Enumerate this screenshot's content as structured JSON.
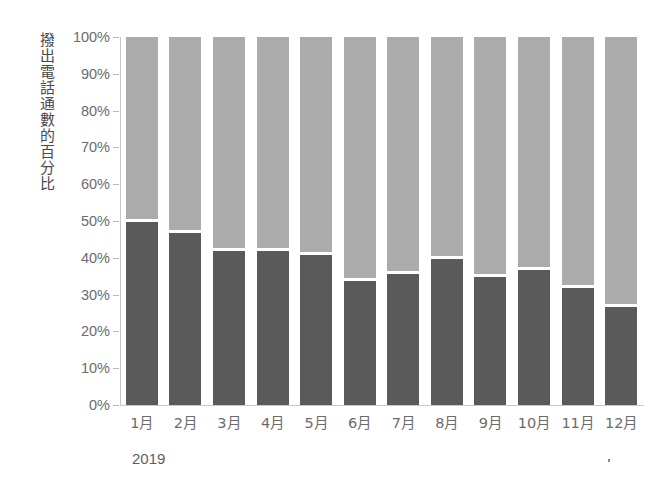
{
  "chart_data": {
    "type": "bar",
    "subtype": "stacked-100-percent",
    "title": "",
    "subtitle": "",
    "xlabel": "",
    "ylabel": "撥出電話通數的百分比",
    "x_group_label": "2019",
    "categories": [
      "1月",
      "2月",
      "3月",
      "4月",
      "5月",
      "6月",
      "7月",
      "8月",
      "9月",
      "10月",
      "11月",
      "12月"
    ],
    "ylim": [
      0,
      100
    ],
    "ytick_labels": [
      "0%",
      "10%",
      "20%",
      "30%",
      "40%",
      "50%",
      "60%",
      "70%",
      "80%",
      "90%",
      "100%"
    ],
    "ytick_values": [
      0,
      10,
      20,
      30,
      40,
      50,
      60,
      70,
      80,
      90,
      100
    ],
    "grid": false,
    "legend_position": "none",
    "series": [
      {
        "name": "下段（深灰）",
        "color": "#5a5a5a",
        "values": [
          50,
          47,
          42,
          42,
          41,
          34,
          36,
          40,
          35,
          37,
          32,
          27
        ]
      },
      {
        "name": "上段（淺灰）",
        "color": "#ababab",
        "values": [
          50,
          53,
          58,
          58,
          59,
          66,
          64,
          60,
          65,
          63,
          68,
          73
        ]
      }
    ],
    "colors": {
      "dark_segment": "#5a5a5a",
      "light_segment": "#ababab",
      "divider": "#ffffff",
      "axis": "#c6c6c6",
      "tick_text": "#6b6b6b",
      "background": "#ffffff"
    },
    "annotations": []
  }
}
